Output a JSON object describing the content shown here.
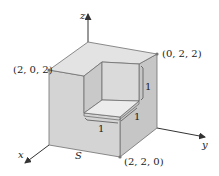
{
  "figure": {
    "surface_label": "S",
    "axes": {
      "x": "x",
      "y": "y",
      "z": "z"
    },
    "points": [
      {
        "id": "p202",
        "label": "(2, 0, 2)"
      },
      {
        "id": "p022",
        "label": "(0, 2, 2)"
      },
      {
        "id": "p220",
        "label": "(2, 2, 0)"
      }
    ],
    "dimensions": [
      {
        "id": "dim-vertical",
        "label": "1"
      },
      {
        "id": "dim-depth",
        "label": "1"
      },
      {
        "id": "dim-width",
        "label": "1"
      }
    ],
    "colors": {
      "top_face": "#e3e3e3",
      "left_face": "#d4d4d4",
      "right_face": "#c6c6c6",
      "notch_left_wall": "#c9c9c9",
      "notch_right_wall": "#dadada",
      "notch_floor": "#ececec",
      "edge": "#6e6e6e",
      "axis": "#333333",
      "vertex": "#777777"
    }
  }
}
